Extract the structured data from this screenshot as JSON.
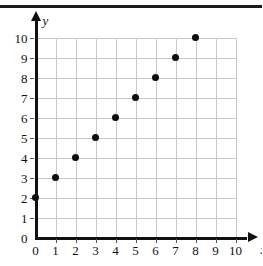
{
  "chart_data": {
    "type": "scatter",
    "title": "",
    "xlabel": "x",
    "ylabel": "y",
    "xlim": [
      0,
      10
    ],
    "ylim": [
      0,
      10
    ],
    "grid": true,
    "legend": "none",
    "x": [
      0,
      1,
      2,
      3,
      4,
      5,
      6,
      7,
      8
    ],
    "y": [
      2,
      3,
      4,
      5,
      6,
      7,
      8,
      9,
      10
    ],
    "points": [
      {
        "x": 0,
        "y": 2
      },
      {
        "x": 1,
        "y": 3
      },
      {
        "x": 2,
        "y": 4
      },
      {
        "x": 3,
        "y": 5
      },
      {
        "x": 4,
        "y": 6
      },
      {
        "x": 5,
        "y": 7
      },
      {
        "x": 6,
        "y": 8
      },
      {
        "x": 7,
        "y": 9
      },
      {
        "x": 8,
        "y": 10
      }
    ],
    "xticks": [
      "0",
      "1",
      "2",
      "3",
      "4",
      "5",
      "6",
      "7",
      "8",
      "9",
      "10"
    ],
    "yticks": [
      "0",
      "1",
      "2",
      "3",
      "4",
      "5",
      "6",
      "7",
      "8",
      "9",
      "10"
    ],
    "colors": {
      "point": "#0d0d0d",
      "axis": "#111111",
      "grid": "#c9c9c9",
      "background": "#ffffff",
      "border": "#1a1a1a"
    }
  }
}
